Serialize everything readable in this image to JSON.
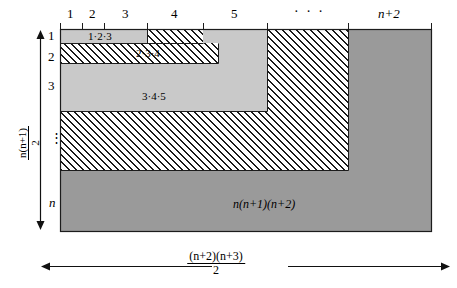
{
  "figure": {
    "colors": {
      "light_gray": "#c9c9c9",
      "dark_gray": "#9a9a9a",
      "hatch_line": "#1a1a1a",
      "outline": "#1c1c1c",
      "background": "#ffffff"
    }
  },
  "top_axis": {
    "labels": [
      "1",
      "2",
      "3",
      "4",
      "5"
    ],
    "ellipsis": "· · ·",
    "last_label": "n+2"
  },
  "left_axis": {
    "labels": [
      "1",
      "2",
      "3"
    ],
    "ellipsis": "⋮",
    "last_label": "n",
    "bracket_label": {
      "numerator": "n(n+1)",
      "denominator": "2"
    }
  },
  "bottom_axis": {
    "bracket_label": {
      "numerator": "(n+2)(n+3)",
      "denominator": "2"
    }
  },
  "region_labels": {
    "band1": "1·2·3",
    "band2": "2·3·4",
    "band3": "3·4·5",
    "total": "n(n+1)(n+2)"
  }
}
